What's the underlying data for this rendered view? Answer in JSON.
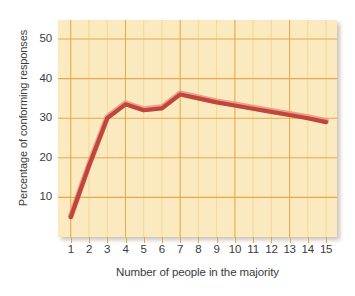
{
  "chart_data": {
    "type": "line",
    "title": "",
    "xlabel": "Number of people in the majority",
    "ylabel": "Percentage of conforming responses",
    "x": [
      1,
      2,
      3,
      4,
      5,
      6,
      7,
      8,
      9,
      10,
      11,
      12,
      13,
      14,
      15
    ],
    "values": [
      5,
      18,
      30,
      33.5,
      32,
      32.5,
      36,
      35,
      34,
      33.2,
      32.4,
      31.6,
      30.8,
      30,
      29
    ],
    "series": [
      {
        "name": "Percentage of conforming responses",
        "values": [
          5,
          18,
          30,
          33.5,
          32,
          32.5,
          36,
          35,
          34,
          33.2,
          32.4,
          31.6,
          30.8,
          30,
          29
        ],
        "color": "#c0453a"
      }
    ],
    "xlim": [
      0.3,
      15.6
    ],
    "ylim": [
      0,
      54.8
    ],
    "xticks": [
      1,
      2,
      3,
      4,
      5,
      6,
      7,
      8,
      9,
      10,
      11,
      12,
      13,
      14,
      15
    ],
    "xtick_labels": [
      "1",
      "2",
      "3",
      "4",
      "5",
      "6",
      "7",
      "8",
      "9",
      "10",
      "11",
      "12",
      "13",
      "14",
      "15"
    ],
    "yticks": [
      10,
      20,
      30,
      40,
      50
    ],
    "ytick_labels": [
      "10",
      "20",
      "30",
      "40",
      "50"
    ],
    "grid": true,
    "grid_major_color": "#e8a33d",
    "grid_minor_color": "#f5d79a",
    "legend": false,
    "legend_position": "none",
    "plot_background": "#fbe9c0",
    "figure_background": "#ffffff",
    "line_color": "#c0453a",
    "line_highlight_color": "#e8938a",
    "line_width": 4.2,
    "annotations": []
  }
}
